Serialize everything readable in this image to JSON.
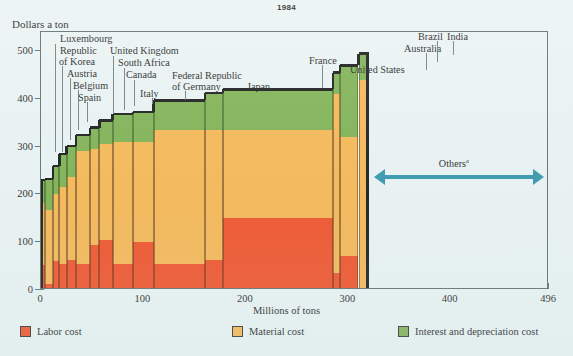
{
  "title": "1984",
  "axes": {
    "y_title": "Dollars a ton",
    "x_title": "Millions of tons",
    "y_ticks": [
      "0",
      "100",
      "200",
      "300",
      "400",
      "500"
    ],
    "x_ticks": [
      "0",
      "100",
      "200",
      "300",
      "400",
      "496"
    ]
  },
  "annotations": {
    "others_label": "Others",
    "others_superscript": "a"
  },
  "legend": [
    {
      "label": "Labor cost",
      "color": "#f04a20"
    },
    {
      "label": "Material cost",
      "color": "#f7b košt"
    },
    {
      "label": "Interest and depreciation cost",
      "color": "#7aae4c"
    }
  ],
  "colors": {
    "labor": "#f04a20",
    "material": "#f6b44e",
    "interest": "#7aae4c",
    "background": "#e9f2f2",
    "frame": "#5a6a6a",
    "arrow": "#2e93a8",
    "cap": "#111111"
  },
  "chart_data": {
    "type": "bar",
    "title": "1984",
    "xlabel": "Millions of tons",
    "ylabel": "Dollars a ton",
    "xlim": [
      0,
      496
    ],
    "ylim": [
      0,
      540
    ],
    "grid": false,
    "legend_position": "bottom",
    "note": "Marimekko / variable-width stacked bar chart. Bar width = production in millions of tons; bar height = cost in dollars a ton, stacked as labor + material + interest and depreciation.",
    "series": [
      {
        "name": "Labor cost",
        "color": "#f04a20"
      },
      {
        "name": "Material cost",
        "color": "#f6b44e"
      },
      {
        "name": "Interest and depreciation cost",
        "color": "#7aae4c"
      }
    ],
    "categories": [
      "Luxembourg",
      "Republic of Korea",
      "Austria",
      "Belgium",
      "Spain",
      "United Kingdom",
      "South Africa",
      "Canada",
      "Italy",
      "Federal Republic of Germany",
      "Japan",
      "France",
      "United States",
      "Australia",
      "Brazil",
      "India"
    ],
    "bars": [
      {
        "label": "Luxembourg",
        "x_start": 0,
        "x_end": 4,
        "labor": 52,
        "material": 130,
        "interest": 48,
        "total": 230
      },
      {
        "label": "Republic of Korea",
        "x_start": 4,
        "x_end": 12,
        "labor": 12,
        "material": 155,
        "interest": 65,
        "total": 232
      },
      {
        "label": "Austria",
        "x_start": 12,
        "x_end": 18,
        "labor": 60,
        "material": 140,
        "interest": 60,
        "total": 260
      },
      {
        "label": "Belgium",
        "x_start": 18,
        "x_end": 25,
        "labor": 55,
        "material": 160,
        "interest": 70,
        "total": 285
      },
      {
        "label": "Spain",
        "x_start": 25,
        "x_end": 34,
        "labor": 62,
        "material": 175,
        "interest": 65,
        "total": 302
      },
      {
        "label": "United Kingdom",
        "x_start": 34,
        "x_end": 48,
        "labor": 55,
        "material": 235,
        "interest": 35,
        "total": 325
      },
      {
        "label": "South Africa",
        "x_start": 48,
        "x_end": 57,
        "labor": 95,
        "material": 200,
        "interest": 45,
        "total": 340
      },
      {
        "label": "Canada",
        "x_start": 57,
        "x_end": 70,
        "labor": 105,
        "material": 200,
        "interest": 50,
        "total": 355
      },
      {
        "label": "Italy",
        "x_start": 70,
        "x_end": 90,
        "labor": 55,
        "material": 255,
        "interest": 58,
        "total": 368
      },
      {
        "label": "Federal Republic of Germany",
        "x_start": 90,
        "x_end": 110,
        "labor": 100,
        "material": 210,
        "interest": 62,
        "total": 372
      },
      {
        "label": "Japan",
        "x_start": 110,
        "x_end": 160,
        "labor": 55,
        "material": 280,
        "interest": 62,
        "total": 397
      },
      {
        "label": "France",
        "x_start": 160,
        "x_end": 178,
        "labor": 62,
        "material": 272,
        "interest": 78,
        "total": 412
      },
      {
        "label": "United States",
        "x_start": 178,
        "x_end": 285,
        "labor": 150,
        "material": 185,
        "interest": 85,
        "total": 420
      },
      {
        "label": "Australia",
        "x_start": 285,
        "x_end": 292,
        "labor": 35,
        "material": 375,
        "interest": 45,
        "total": 455
      },
      {
        "label": "Brazil",
        "x_start": 292,
        "x_end": 310,
        "labor": 72,
        "material": 248,
        "interest": 150,
        "total": 470
      },
      {
        "label": "India",
        "x_start": 310,
        "x_end": 320,
        "labor": 0,
        "material": 440,
        "interest": 55,
        "total": 495
      }
    ],
    "others_range": [
      320,
      496
    ]
  },
  "callouts": [
    {
      "text": "Luxembourg"
    },
    {
      "text": "Republic"
    },
    {
      "text": "of Korea"
    },
    {
      "text": "Austria"
    },
    {
      "text": "Belgium"
    },
    {
      "text": "Spain"
    },
    {
      "text": "United Kingdom"
    },
    {
      "text": "South Africa"
    },
    {
      "text": "Canada"
    },
    {
      "text": "Italy"
    },
    {
      "text": "Federal Republic"
    },
    {
      "text": "of Germany"
    },
    {
      "text": "Japan"
    },
    {
      "text": "France"
    },
    {
      "text": "United States"
    },
    {
      "text": "Australia"
    },
    {
      "text": "Brazil"
    },
    {
      "text": "India"
    }
  ]
}
